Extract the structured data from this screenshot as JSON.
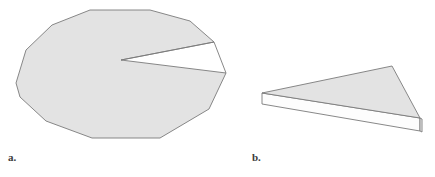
{
  "figure": {
    "background_color": "#ffffff",
    "stroke_color": "#7a7a7a",
    "fill_gray": "#e3e3e3",
    "fill_white": "#fdfdfd",
    "label_color": "#3c3c3c",
    "panels": [
      {
        "id": "a",
        "label": "a.",
        "caption_x": 8,
        "caption_y": 152,
        "shape_name": "notched-polygon",
        "description": "filled dodecagonal disk with a thin wedge notch cut from the right edge to the center",
        "outline_points": "90,10 150,10 190,21 214,42 121,60 226,73 209,109 160,138 92,138 46,121 20,97 16,83 26,50 52,25",
        "notch_points": "121,60 214,42 226,73"
      },
      {
        "id": "b",
        "label": "b.",
        "caption_x": 252,
        "caption_y": 152,
        "shape_name": "triangular-wedge-prism",
        "description": "three dimensional triangular wedge shown in perspective with a shaded top face and unshaded front and right side faces",
        "top_face_points": "262,93 392,66 420,118",
        "front_face_points": "262,93 420,118 420,131 262,104",
        "side_face_points": "420,118 422,119 422,132 420,131"
      }
    ]
  },
  "chart_data": {
    "type": "diagram",
    "title": "",
    "items": [
      {
        "label": "a.",
        "shape": "notched polygon (disk with wedge removed)",
        "sides": 14,
        "bounds": {
          "x": 16,
          "y": 10,
          "width": 210,
          "height": 128
        },
        "notch_apex": [
          121,
          60
        ],
        "notch_opening": [
          [
            214,
            42
          ],
          [
            226,
            73
          ]
        ]
      },
      {
        "label": "b.",
        "shape": "triangular wedge prism (perspective)",
        "bounds": {
          "x": 262,
          "y": 66,
          "width": 160,
          "height": 66
        },
        "top_face_vertices": [
          [
            262,
            93
          ],
          [
            392,
            66
          ],
          [
            420,
            118
          ]
        ],
        "thickness_px": 12
      }
    ]
  }
}
